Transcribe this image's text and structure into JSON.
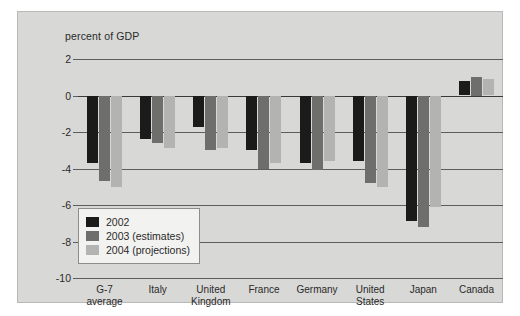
{
  "chart_data": {
    "type": "bar",
    "title": "",
    "subtitle": "",
    "xlabel": "",
    "ylabel": "percent of GDP",
    "ylim": [
      -10,
      2
    ],
    "yticks": [
      2,
      0,
      -2,
      -4,
      -6,
      -8,
      -10
    ],
    "ytick_labels": [
      "2",
      "0",
      "-2",
      "-4",
      "-6",
      "-8",
      "-10"
    ],
    "grid": true,
    "legend_position": "inside-lower-left",
    "categories": [
      "G-7\naverage",
      "Italy",
      "United\nKingdom",
      "France",
      "Germany",
      "United\nStates",
      "Japan",
      "Canada"
    ],
    "series": [
      {
        "name": "2002",
        "color": "#1b1b1b",
        "values": [
          -3.7,
          -2.4,
          -1.7,
          -3.0,
          -3.7,
          -3.6,
          -6.9,
          0.8
        ]
      },
      {
        "name": "2003 (estimates)",
        "color": "#6e6e6c",
        "values": [
          -4.7,
          -2.6,
          -3.0,
          -4.0,
          -4.1,
          -4.8,
          -7.2,
          1.0
        ]
      },
      {
        "name": "2004 (projections)",
        "color": "#b3b3b1",
        "values": [
          -5.0,
          -2.9,
          -2.9,
          -3.7,
          -3.6,
          -5.0,
          -6.1,
          0.9
        ]
      }
    ]
  },
  "legend": {
    "entries": [
      {
        "label": "2002"
      },
      {
        "label": "2003 (estimates)"
      },
      {
        "label": "2004 (projections)"
      }
    ]
  },
  "colors": {
    "panel_background": "#d8d8d6",
    "series_2002": "#1b1b1b",
    "series_2003": "#6e6e6c",
    "series_2004": "#b3b3b1",
    "gridline": "#5d5d5b",
    "text": "#2a2a2a"
  }
}
